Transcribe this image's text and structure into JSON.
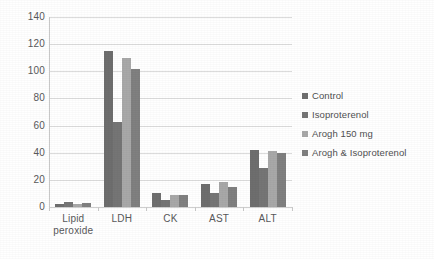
{
  "chart_data": {
    "type": "bar",
    "title": "",
    "subtitle": "",
    "xlabel": "",
    "ylabel": "",
    "ylim": [
      0,
      140
    ],
    "ytick_values": [
      0,
      20,
      40,
      60,
      80,
      100,
      120,
      140
    ],
    "ytick_labels": [
      "0",
      "20",
      "40",
      "60",
      "80",
      "100",
      "120",
      "140"
    ],
    "grid": "horizontal",
    "legend_position": "right",
    "categories": [
      "Lipid peroxide",
      "LDH",
      "CK",
      "AST",
      "ALT"
    ],
    "category_labels": [
      [
        "Lipid",
        "peroxide"
      ],
      [
        "LDH"
      ],
      [
        "CK"
      ],
      [
        "AST"
      ],
      [
        "ALT"
      ]
    ],
    "series": [
      {
        "name": "Control",
        "color": "#6e6e6e",
        "values": [
          2.5,
          115,
          10,
          17,
          42
        ]
      },
      {
        "name": "Isoproterenol",
        "color": "#757575",
        "values": [
          4.0,
          63,
          5.5,
          10,
          29
        ]
      },
      {
        "name": "Arogh 150 mg",
        "color": "#a8a8a8",
        "values": [
          2.5,
          110,
          9,
          18.5,
          41
        ]
      },
      {
        "name": "Arogh & Isoproterenol",
        "color": "#808080",
        "values": [
          3.0,
          102,
          8.5,
          15,
          40
        ]
      }
    ]
  },
  "colors": {
    "gridline": "#dcdcdc",
    "axis": "#c9c9c9",
    "tick_text": "#58585a",
    "legend_text": "#4f4f51",
    "background": "#ffffff"
  },
  "legend": {
    "items": [
      {
        "label": "Control",
        "swatch": "#6e6e6e"
      },
      {
        "label": "Isoproterenol",
        "swatch": "#757575"
      },
      {
        "label": "Arogh 150 mg",
        "swatch": "#a8a8a8"
      },
      {
        "label": "Arogh & Isoproterenol",
        "swatch": "#808080"
      }
    ]
  }
}
